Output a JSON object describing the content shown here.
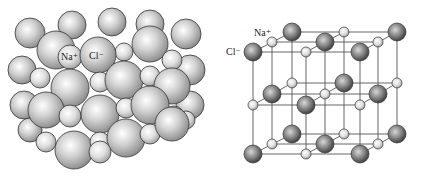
{
  "figure": {
    "left_panel": {
      "title": "space-filling model",
      "labels": {
        "sodium": "Na⁺",
        "chloride": "Cl⁻"
      }
    },
    "right_panel": {
      "title": "ball-and-stick lattice",
      "labels": {
        "sodium": "Na⁺",
        "chloride": "Cl⁻"
      }
    },
    "colors": {
      "sphere_light": "#f2f2f2",
      "sphere_mid": "#c8c8c8",
      "sphere_dark": "#6e6e6e",
      "outline": "#333333",
      "bond": "#555555"
    }
  }
}
